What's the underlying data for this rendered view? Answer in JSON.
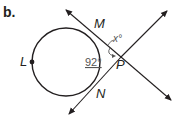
{
  "figure": {
    "part_label": "b.",
    "points": {
      "L": "L",
      "M": "M",
      "N": "N",
      "P": "P"
    },
    "angles": {
      "arc_measure": "92°",
      "unknown_angle": "x°"
    },
    "colors": {
      "stroke": "#231f20",
      "angle_text": "#555555"
    }
  }
}
